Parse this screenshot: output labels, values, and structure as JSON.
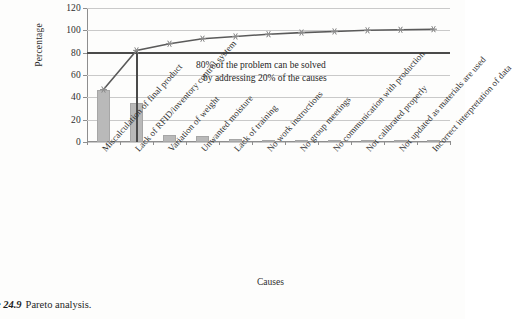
{
  "caption": {
    "label": "ure 24.9",
    "text": "Pareto analysis."
  },
  "chart_data": {
    "type": "bar",
    "title": "",
    "xlabel": "Causes",
    "ylabel": "Percentage",
    "ylim": [
      0,
      120
    ],
    "yticks": [
      0,
      20,
      40,
      60,
      80,
      100,
      120
    ],
    "grid": true,
    "legend": "none",
    "categories": [
      "Miscalculation of final product",
      "Lack of RFID/inventory control system",
      "Variation of weight",
      "Unwanted moisture",
      "Lack of training",
      "No work instructions",
      "No group meetings",
      "No communication with production",
      "Not calibrated properly",
      "Not updated as materials are used",
      "Incorrect interpretation of data"
    ],
    "series": [
      {
        "name": "Percentage",
        "type": "bar",
        "values": [
          47,
          35,
          6,
          5,
          2.5,
          2,
          1.5,
          1,
          1,
          0.5,
          0.5
        ]
      },
      {
        "name": "Cumulative percentage",
        "type": "line",
        "marker": "asterisk",
        "values": [
          47,
          82,
          88,
          92.5,
          94.5,
          96.5,
          98,
          99,
          100,
          100.5,
          101
        ]
      }
    ],
    "reference_lines": [
      {
        "name": "80-percent-line",
        "orientation": "horizontal",
        "value": 80
      },
      {
        "name": "vital-few-divider",
        "orientation": "vertical",
        "at_category_index": 1
      }
    ],
    "annotation": {
      "line1": "80% of the problem can be solved",
      "line2": "by addressing 20% of the causes"
    },
    "colors": {
      "bar_fill": "#b9b9b9",
      "bar_stroke": "#a6a6a6",
      "line": "#5a5a5a",
      "reference_line": "#4a4a4a",
      "grid": "#c9c9c9",
      "axis": "#8e8e8e"
    }
  }
}
